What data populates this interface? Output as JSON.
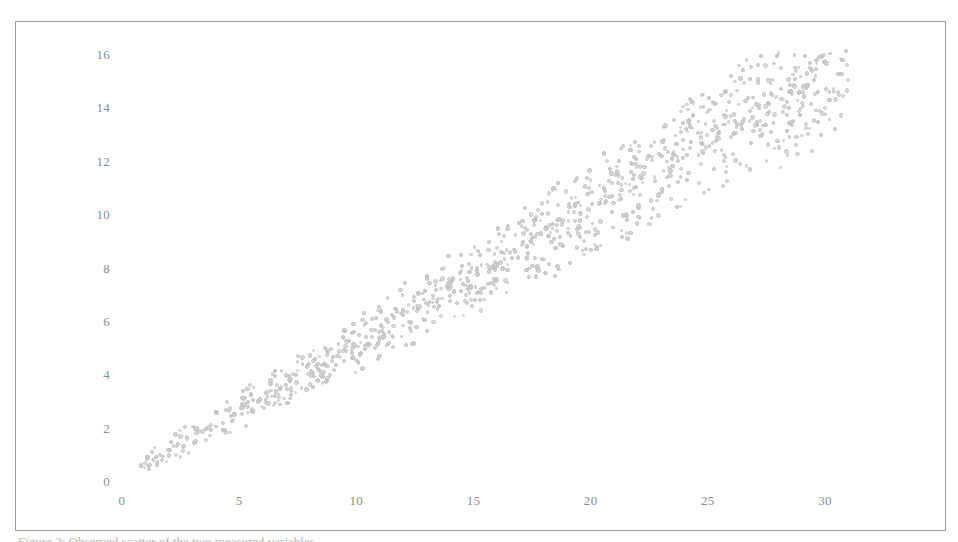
{
  "figure": {
    "background_color": "#ffffff",
    "frame_color": "#9a9a9a",
    "tick_label_color": "#8d8d8d",
    "point_color": "#d2d2d2",
    "point_edge_color": "#bdbdbd",
    "caption_partial": "Figure 2: Observed scatter of the two measured variables."
  },
  "chart_data": {
    "type": "scatter",
    "title": "",
    "subtitle": "",
    "xlabel": "",
    "ylabel": "",
    "xlim": [
      -0.9,
      35.2
    ],
    "ylim": [
      -0.5,
      17.3
    ],
    "xticks": [
      0,
      5,
      10,
      15,
      20,
      25,
      30
    ],
    "xticklabels": [
      "0",
      "5",
      "10",
      "15",
      "20",
      "25",
      "30"
    ],
    "yticks": [
      0,
      2,
      4,
      6,
      8,
      10,
      12,
      14,
      16
    ],
    "yticklabels": [
      "0",
      "2",
      "4",
      "6",
      "8",
      "10",
      "12",
      "14",
      "16"
    ],
    "grid": false,
    "legend": null,
    "annotations": [],
    "n_points": 1000,
    "marker": "circle",
    "marker_size": 4,
    "relationship": "positive linear, y ~ 0.5x with widening spread",
    "series": [
      {
        "name": "observations",
        "color": "#d2d2d2",
        "x_range": [
          0.7,
          31.0
        ],
        "y_range": [
          0.4,
          15.8
        ],
        "approx_slope": 0.5,
        "approx_intercept": 0.15,
        "noise_band_halfwidth_at_x0": 0.35,
        "noise_band_halfwidth_at_x30": 2.6
      }
    ]
  }
}
